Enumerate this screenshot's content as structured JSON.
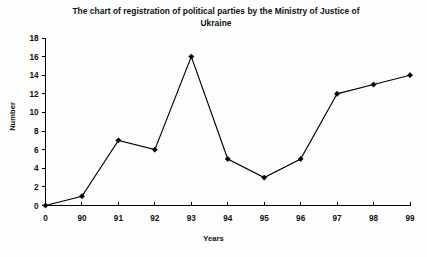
{
  "chart_data": {
    "type": "line",
    "title": "The chart of registration of political parties by the Ministry of Justice of Ukraine",
    "title_line1": "The chart of registration of political parties by the Ministry of Justice of",
    "title_line2": "Ukraine",
    "xlabel": "Years",
    "ylabel": "Number",
    "categories": [
      "0",
      "90",
      "91",
      "92",
      "93",
      "94",
      "95",
      "96",
      "97",
      "98",
      "99"
    ],
    "values": [
      0,
      1,
      7,
      6,
      16,
      5,
      3,
      5,
      12,
      13,
      14
    ],
    "ylim": [
      0,
      18
    ],
    "ytick_labels": [
      "0",
      "2",
      "4",
      "6",
      "8",
      "10",
      "12",
      "14",
      "16",
      "18"
    ],
    "yticks": [
      0,
      2,
      4,
      6,
      8,
      10,
      12,
      14,
      16,
      18
    ],
    "grid": false,
    "legend": false,
    "marker": "diamond",
    "line_color": "#000000",
    "marker_color": "#000000",
    "background_color": "#fdfdfd"
  }
}
